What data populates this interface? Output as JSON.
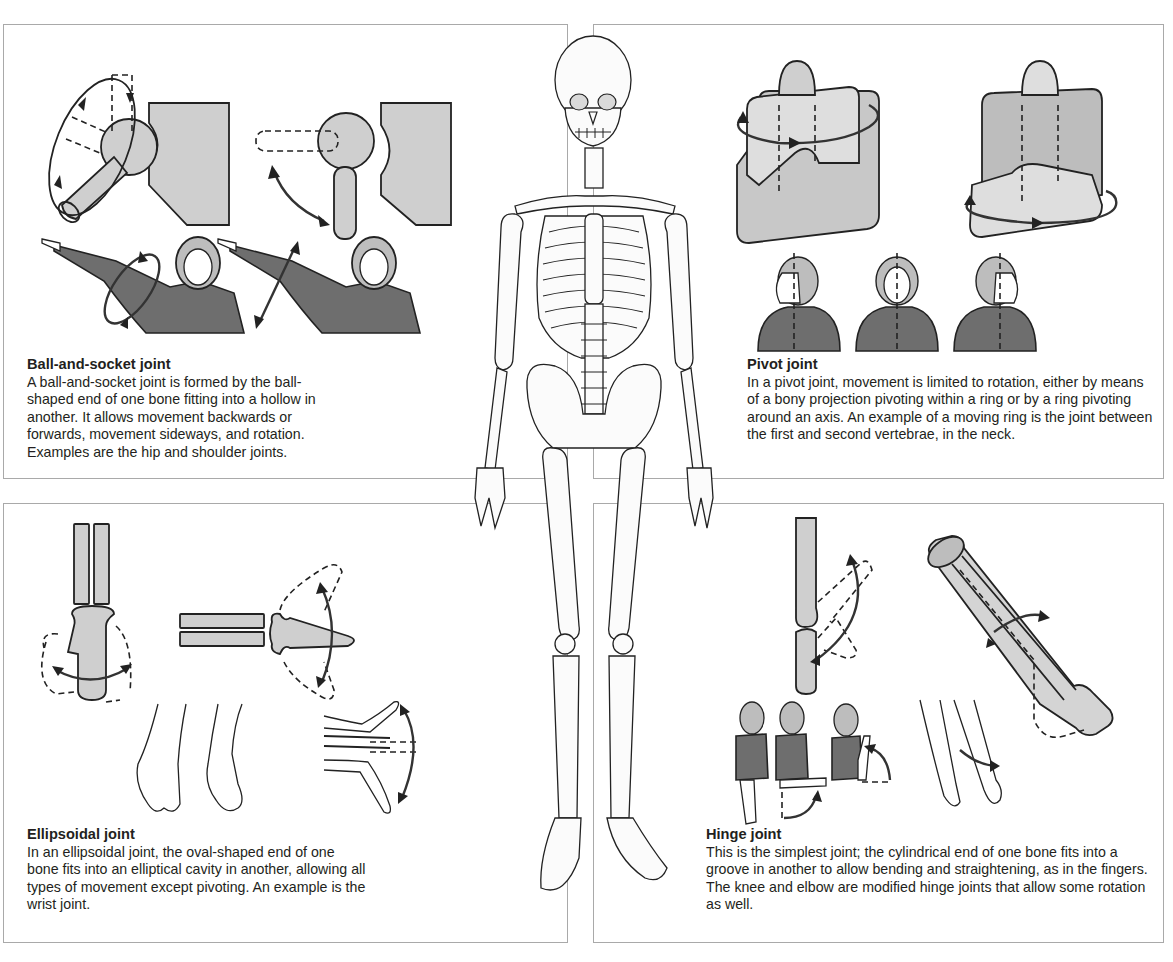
{
  "figure": {
    "center_illustration": "human-skeleton-front-view"
  },
  "panels": {
    "ball_and_socket": {
      "title": "Ball-and-socket joint",
      "body": "A ball-and-socket joint is formed by the ball-shaped end of one bone fitting into a hollow in another. It allows movement backwards or forwards, movement sideways, and rotation. Examples are the hip and shoulder joints.",
      "illustrations": [
        "ball-socket-rotation-diagram",
        "ball-socket-swing-diagram",
        "arm-rotation-figure",
        "arm-swing-figure"
      ]
    },
    "pivot": {
      "title": "Pivot joint",
      "body": "In a pivot joint, movement is limited to rotation, either by means of a bony projection pivoting within a ring or by a ring pivoting around an axis. An example of a moving ring is the joint between the first and second vertebrae, in the neck.",
      "illustrations": [
        "pivot-projection-block",
        "pivot-ring-block",
        "head-turn-left-figure",
        "head-front-figure",
        "head-turn-right-figure"
      ]
    },
    "ellipsoidal": {
      "title": "Ellipsoidal joint",
      "body": "In an ellipsoidal joint, the oval-shaped end of one bone fits into an elliptical cavity in another, allowing all types of movement except pivoting. An example is the wrist joint.",
      "illustrations": [
        "ellipsoid-front-diagram",
        "ellipsoid-side-diagram",
        "hands-side-to-side",
        "wrist-flex-extend"
      ]
    },
    "hinge": {
      "title": "Hinge joint",
      "body": "This is the simplest joint; the cylindrical end of one bone fits into a groove in another to allow bending and straightening, as in the fingers. The knee and elbow are modified hinge joints that allow some rotation as well.",
      "illustrations": [
        "hinge-bone-diagram",
        "forearm-rotation-tube",
        "elbow-bend-figures",
        "forearm-rotation-arms"
      ]
    }
  },
  "colors": {
    "panel_border": "#a9a9a9",
    "shape_fill_light": "#cfcfcf",
    "shirt_fill": "#6e6e6e",
    "ink": "#231f20"
  }
}
